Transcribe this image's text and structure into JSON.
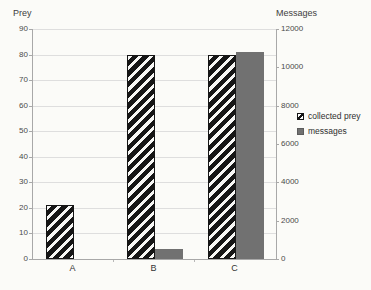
{
  "chart_data": {
    "type": "bar",
    "title": "",
    "categories": [
      "A",
      "B",
      "C"
    ],
    "series": [
      {
        "name": "collected prey",
        "axis": "left",
        "style": "hatched",
        "values": [
          21,
          80,
          80
        ]
      },
      {
        "name": "messages",
        "axis": "right",
        "style": "solid",
        "values": [
          0,
          500,
          10800
        ]
      }
    ],
    "left_axis": {
      "title": "Prey",
      "min": 0,
      "max": 90,
      "step": 10,
      "ticks": [
        0,
        10,
        20,
        30,
        40,
        50,
        60,
        70,
        80,
        90
      ]
    },
    "right_axis": {
      "title": "Messages",
      "min": 0,
      "max": 12000,
      "step": 2000,
      "ticks": [
        0,
        2000,
        4000,
        6000,
        8000,
        10000,
        12000
      ]
    },
    "legend": {
      "position": "right",
      "entries": [
        "collected prey",
        "messages"
      ]
    },
    "grid": true,
    "colors": {
      "messages_bar": "#717171",
      "hatch_dark": "#161616",
      "gridline": "#dedede",
      "axis_line": "#a8a8a8",
      "text": "#3d3d3d",
      "background": "#fbfbf8"
    }
  }
}
